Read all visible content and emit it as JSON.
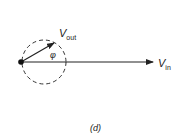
{
  "diagram": {
    "panel_label": "(d)",
    "vectors": [
      {
        "name": "V_out",
        "label_main": "V",
        "label_sub": "out",
        "angle_label": "φ"
      },
      {
        "name": "V_in",
        "label_main": "V",
        "label_sub": "in"
      }
    ],
    "colors": {
      "stroke": "#222222",
      "background": "#ffffff"
    }
  }
}
